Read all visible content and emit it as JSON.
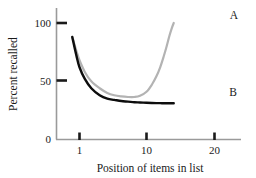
{
  "chart_data": {
    "type": "line",
    "title": "",
    "subtitle": "",
    "xlabel": "Position of items in list",
    "ylabel": "Percent recalled",
    "xscale": "log",
    "yscale": "linear",
    "xlim": [
      0.72,
      26
    ],
    "ylim": [
      0,
      108
    ],
    "xticks": [
      1,
      10,
      20
    ],
    "xticklabels": [
      "1",
      "10",
      "20"
    ],
    "yticks": [
      0,
      50,
      100
    ],
    "yticklabels": [
      "0",
      "50",
      "100"
    ],
    "grid": false,
    "legend_position": "inline-right-end",
    "series": [
      {
        "name": "A",
        "label": "A",
        "color": "#b3b3b3",
        "linewidth": 2.2,
        "annotation": "A",
        "x": [
          0.78,
          0.9,
          1.0,
          1.2,
          1.5,
          2.0,
          2.6,
          3.3,
          4.2,
          5.3,
          6.6,
          8.0,
          10.0,
          12.0,
          14.0,
          16.0,
          18.0,
          20.0,
          22.0,
          24.0,
          25.5
        ],
        "y": [
          88,
          76,
          68,
          58,
          50,
          44,
          40,
          38,
          37,
          36.5,
          36.5,
          37.5,
          41,
          47,
          54,
          62,
          71,
          80,
          89,
          96,
          100
        ]
      },
      {
        "name": "B",
        "label": "B",
        "color": "#0d0d0d",
        "linewidth": 2.4,
        "annotation": "B",
        "x": [
          0.78,
          0.9,
          1.0,
          1.2,
          1.5,
          2.0,
          2.6,
          3.3,
          4.2,
          5.3,
          6.6,
          8.0,
          10.0,
          12.0,
          14.0,
          16.0,
          18.0,
          20.0,
          22.0,
          24.0,
          25.5
        ],
        "y": [
          88,
          72,
          62,
          52,
          44,
          38,
          35,
          34,
          33,
          32.5,
          32,
          31.8,
          31.5,
          31.3,
          31.2,
          31.2,
          31.1,
          31.1,
          31.1,
          31.1,
          31.1
        ]
      }
    ],
    "axis_color": "#9a9a9a",
    "tick_color": "#1a1a1a",
    "background_color": "#ffffff"
  },
  "annotations": {
    "series_a_label": "A",
    "series_b_label": "B"
  },
  "axes": {
    "y_title": "Percent recalled",
    "x_title": "Position of items in list",
    "y_tick_0": "0",
    "y_tick_50": "50",
    "y_tick_100": "100",
    "x_tick_1": "1",
    "x_tick_10": "10",
    "x_tick_20": "20"
  }
}
